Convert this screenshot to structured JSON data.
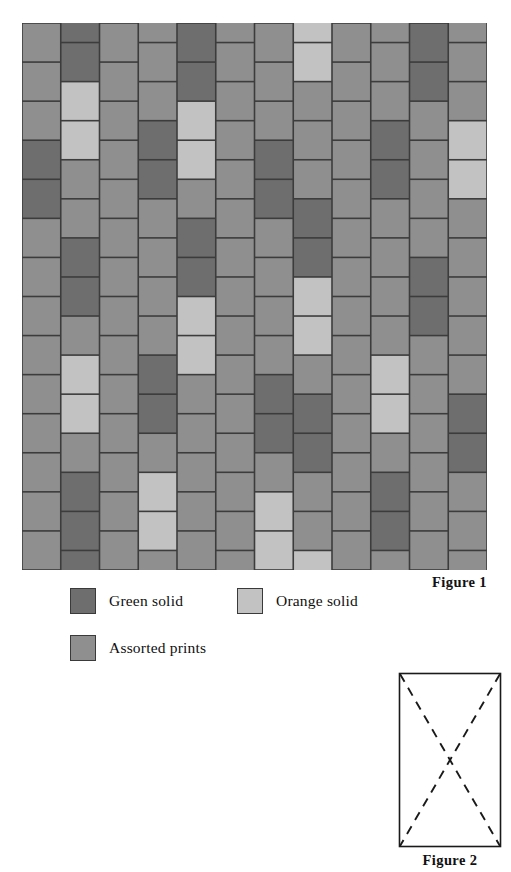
{
  "figure1": {
    "caption": "Figure 1",
    "description": "Quilt layout of vertical rectangular patches in a running-bond brick set",
    "columns": 12,
    "rows": 14,
    "brick_width": 38.75,
    "brick_height": 39.07,
    "sash_color": "#3c3c3c",
    "background_color": "#8c8c8c",
    "fabric_colors": {
      "green_solid": "#6e6e6e",
      "orange_solid": "#c2c2c2",
      "assorted_prints": "#8f8f8f"
    },
    "grid": [
      [
        "P",
        "G",
        "P",
        "P",
        "G",
        "P",
        "P",
        "O",
        "P",
        "P",
        "G",
        "P"
      ],
      [
        "P",
        "G",
        "P",
        "P",
        "G",
        "P",
        "P",
        "O",
        "P",
        "P",
        "G",
        "P"
      ],
      [
        "P",
        "O",
        "P",
        "P",
        "O",
        "P",
        "P",
        "P",
        "P",
        "P",
        "P",
        "P"
      ],
      [
        "G",
        "O",
        "P",
        "G",
        "O",
        "P",
        "G",
        "P",
        "P",
        "G",
        "P",
        "O"
      ],
      [
        "G",
        "P",
        "P",
        "G",
        "P",
        "P",
        "G",
        "P",
        "P",
        "G",
        "P",
        "O"
      ],
      [
        "P",
        "P",
        "P",
        "P",
        "G",
        "P",
        "P",
        "G",
        "P",
        "P",
        "P",
        "P"
      ],
      [
        "P",
        "G",
        "P",
        "P",
        "G",
        "P",
        "P",
        "G",
        "P",
        "P",
        "G",
        "P"
      ],
      [
        "P",
        "G",
        "P",
        "P",
        "O",
        "P",
        "P",
        "O",
        "P",
        "P",
        "G",
        "P"
      ],
      [
        "P",
        "P",
        "P",
        "P",
        "O",
        "P",
        "P",
        "O",
        "P",
        "P",
        "P",
        "P"
      ],
      [
        "P",
        "O",
        "P",
        "G",
        "P",
        "P",
        "G",
        "P",
        "P",
        "O",
        "P",
        "P"
      ],
      [
        "P",
        "O",
        "P",
        "G",
        "P",
        "P",
        "G",
        "G",
        "P",
        "O",
        "P",
        "G"
      ],
      [
        "P",
        "P",
        "P",
        "P",
        "P",
        "P",
        "P",
        "G",
        "P",
        "P",
        "P",
        "G"
      ],
      [
        "P",
        "G",
        "P",
        "O",
        "P",
        "P",
        "O",
        "P",
        "P",
        "G",
        "P",
        "P"
      ],
      [
        "P",
        "G",
        "P",
        "O",
        "P",
        "P",
        "O",
        "P",
        "P",
        "G",
        "P",
        "P"
      ]
    ]
  },
  "legend": {
    "entries": [
      {
        "label": "Green solid",
        "swatch_color": "#6e6e6e",
        "key": "green_solid"
      },
      {
        "label": "Orange solid",
        "swatch_color": "#c2c2c2",
        "key": "orange_solid"
      },
      {
        "label": "Assorted prints",
        "swatch_color": "#8f8f8f",
        "key": "assorted_prints"
      }
    ]
  },
  "figure2": {
    "caption": "Figure 2",
    "description": "Rectangle with dashed X quilting lines from corner to corner",
    "outline_color": "#1a1a1a",
    "dash_color": "#1a1a1a",
    "width": 104,
    "height": 176,
    "lines": [
      {
        "name": "diagonal-top-left-to-bottom-right",
        "x1": 2,
        "y1": 2,
        "x2": 102,
        "y2": 174
      },
      {
        "name": "diagonal-top-right-to-bottom-left",
        "x1": 102,
        "y1": 2,
        "x2": 2,
        "y2": 174
      }
    ]
  }
}
